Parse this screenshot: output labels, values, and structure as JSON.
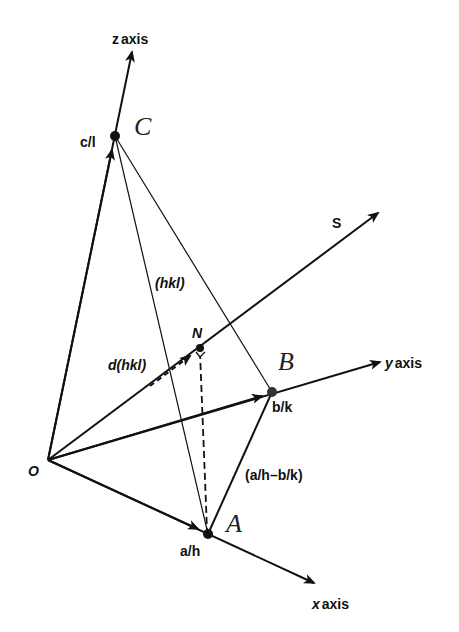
{
  "diagram": {
    "colors": {
      "line": "#111111",
      "background": "#ffffff"
    },
    "points": {
      "origin": {
        "label": "O",
        "x": 48,
        "y": 460
      },
      "A": {
        "label": "A",
        "intercept": "a/h",
        "x": 208,
        "y": 534
      },
      "B": {
        "label": "B",
        "intercept": "b/k",
        "x": 272,
        "y": 392
      },
      "C": {
        "label": "C",
        "intercept": "c/l",
        "x": 115,
        "y": 136
      },
      "N": {
        "label": "N",
        "x": 200,
        "y": 348
      }
    },
    "axes": {
      "x": {
        "label_var": "x",
        "label_word": "axis"
      },
      "y": {
        "label_var": "y",
        "label_word": "axis"
      },
      "z": {
        "label_var": "z",
        "label_word": "axis"
      }
    },
    "vectors": {
      "S": "S",
      "d": "d(hkl)"
    },
    "plane_label": "(hkl)",
    "edge_AB_label": "(a/h–b/k)"
  }
}
